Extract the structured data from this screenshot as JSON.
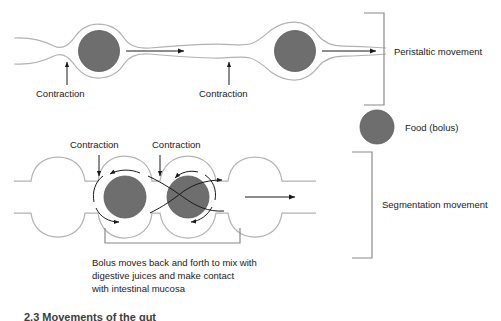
{
  "figure": {
    "type": "biology-diagram",
    "background_color": "#ffffff",
    "bolus_color": "#6e6e6e",
    "bolus_stroke_color": "#5a5a5a",
    "wall_color": "#b3b3b3",
    "arrow_color": "#1a1a1a",
    "bracket_color": "#8a8a8a",
    "text_color": "#1a1a1a"
  },
  "peristalsis": {
    "section_label": "Peristaltic movement",
    "contraction_label_1": "Contraction",
    "contraction_label_2": "Contraction",
    "bolus_count": 2,
    "direction": "left-to-right"
  },
  "legend": {
    "bolus_label": "Food (bolus)"
  },
  "segmentation": {
    "section_label": "Segmentation movement",
    "contraction_label_1": "Contraction",
    "contraction_label_2": "Contraction",
    "bolus_count": 2,
    "caption_line_1": "Bolus moves back and forth to mix with",
    "caption_line_2": "digestive juices and make contact",
    "caption_line_3": "with intestinal mucosa"
  },
  "footer": {
    "cut_off_caption": "2.3   Movements of the gut"
  }
}
